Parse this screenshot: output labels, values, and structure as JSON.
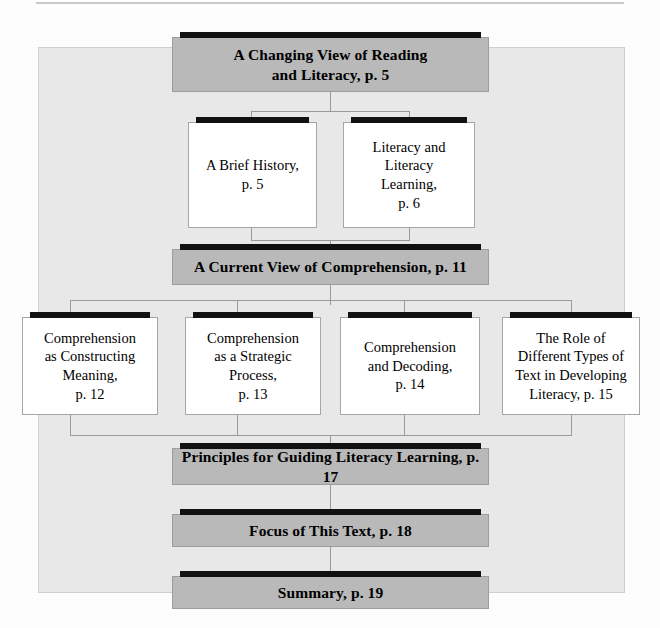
{
  "diagram": {
    "type": "flowchart",
    "colors": {
      "panel_background": "#e8e8e8",
      "gray_node": "#b9b9b9",
      "white_node": "#ffffff",
      "shadow_bar": "#111111",
      "connector": "#9a9a9a",
      "page_background": "#fdfdfd"
    },
    "nodes": [
      {
        "id": "changing-view",
        "style": "gray",
        "lines": [
          "A Changing View of Reading",
          "and Literacy, p. 5"
        ],
        "page": "p. 5"
      },
      {
        "id": "brief-history",
        "style": "white",
        "lines": [
          "A Brief History,",
          "p. 5"
        ],
        "page": "p. 5"
      },
      {
        "id": "literacy-and-literacy-learning",
        "style": "white",
        "lines": [
          "Literacy and",
          "Literacy",
          "Learning,",
          "p. 6"
        ],
        "page": "p. 6"
      },
      {
        "id": "current-view-comprehension",
        "style": "gray",
        "lines": [
          "A Current View of Comprehension, p. 11"
        ],
        "page": "p. 11"
      },
      {
        "id": "comprehension-constructing-meaning",
        "style": "white",
        "lines": [
          "Comprehension",
          "as Constructing",
          "Meaning,",
          "p. 12"
        ],
        "page": "p. 12"
      },
      {
        "id": "comprehension-strategic-process",
        "style": "white",
        "lines": [
          "Comprehension",
          "as a Strategic",
          "Process,",
          "p. 13"
        ],
        "page": "p. 13"
      },
      {
        "id": "comprehension-and-decoding",
        "style": "white",
        "lines": [
          "Comprehension",
          "and Decoding,",
          "p. 14"
        ],
        "page": "p. 14"
      },
      {
        "id": "role-of-different-text-types",
        "style": "white",
        "lines": [
          "The Role of",
          "Different Types of",
          "Text in Developing",
          "Literacy, p. 15"
        ],
        "page": "p. 15"
      },
      {
        "id": "principles-guiding-literacy-learning",
        "style": "gray",
        "lines": [
          "Principles for Guiding Literacy Learning, p. 17"
        ],
        "page": "p. 17"
      },
      {
        "id": "focus-of-this-text",
        "style": "gray",
        "lines": [
          "Focus of This Text, p. 18"
        ],
        "page": "p. 18"
      },
      {
        "id": "summary",
        "style": "gray",
        "lines": [
          "Summary, p. 19"
        ],
        "page": "p. 19"
      }
    ]
  }
}
